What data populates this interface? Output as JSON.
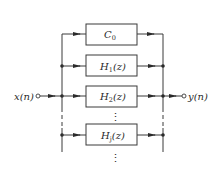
{
  "diagram": {
    "type": "parallel-filter-bank-block-diagram",
    "input": {
      "label": "x(n)"
    },
    "output": {
      "label": "y(n)"
    },
    "blocks": [
      {
        "name": "C",
        "subscript": "0",
        "suffix": ""
      },
      {
        "name": "H",
        "subscript": "1",
        "suffix": "(z)"
      },
      {
        "name": "H",
        "subscript": "2",
        "suffix": "(z)"
      },
      {
        "name": "H",
        "subscript": "j",
        "suffix": "(z)"
      }
    ],
    "ellipsis": "⋮",
    "colors": {
      "line": "#3a3a3a",
      "text": "#2a2a2a",
      "background": "#ffffff"
    }
  }
}
